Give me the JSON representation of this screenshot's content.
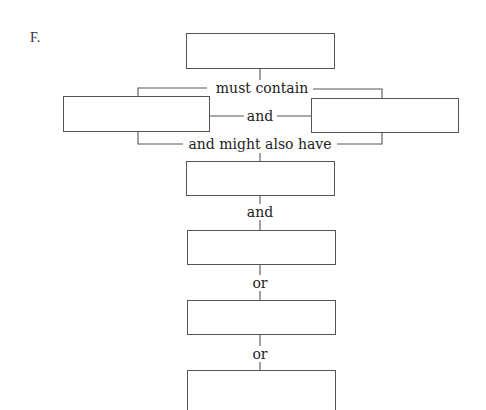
{
  "section_label": "F.",
  "diagram": {
    "connectors": {
      "must_contain": "must contain",
      "and_middle": "and",
      "might_also_have": "and might also have",
      "and_lower": "and",
      "or_first": "or",
      "or_second": "or"
    },
    "boxes": [
      {
        "id": "top",
        "text": ""
      },
      {
        "id": "left",
        "text": ""
      },
      {
        "id": "right",
        "text": ""
      },
      {
        "id": "center-1",
        "text": ""
      },
      {
        "id": "center-2",
        "text": ""
      },
      {
        "id": "center-3",
        "text": ""
      },
      {
        "id": "center-4",
        "text": ""
      }
    ],
    "line_color": "#555555"
  }
}
